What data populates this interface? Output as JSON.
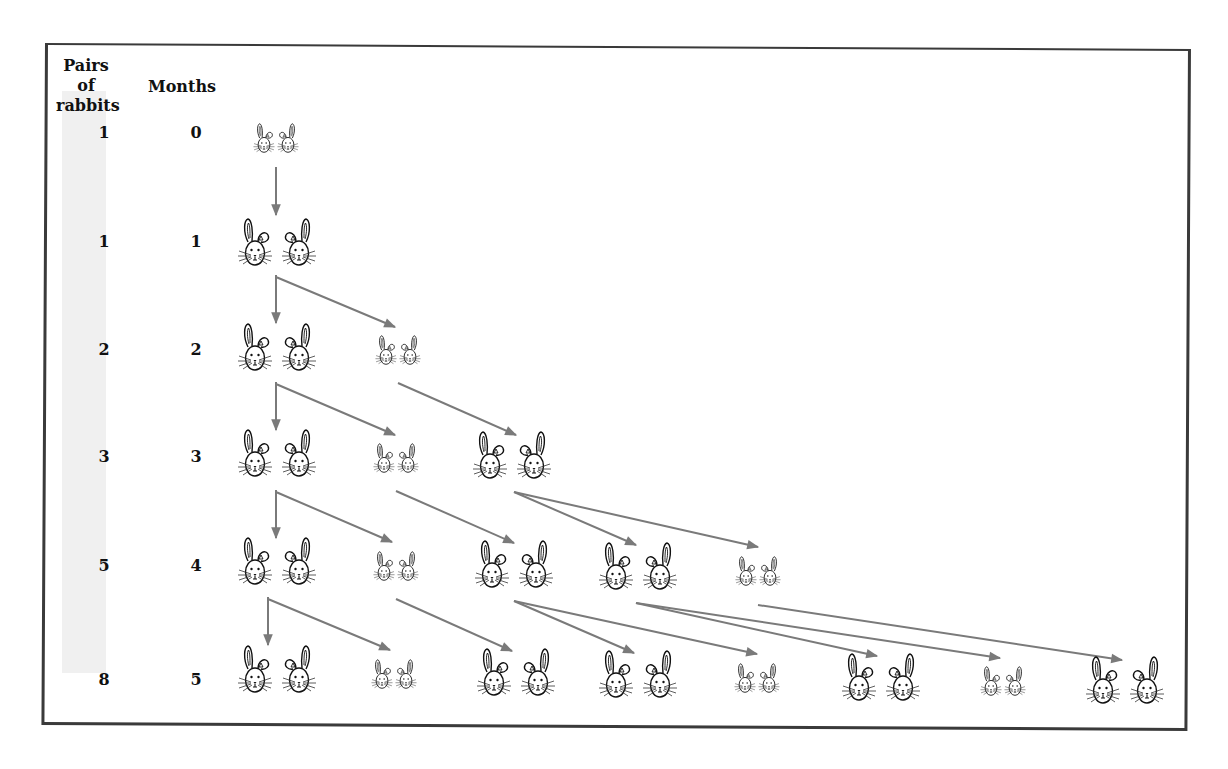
{
  "headers": {
    "pairs": [
      "Pairs of",
      "rabbits"
    ],
    "months": "Months"
  },
  "rows": [
    {
      "pairs": "1",
      "month": "0",
      "y": 133
    },
    {
      "pairs": "1",
      "month": "1",
      "y": 242
    },
    {
      "pairs": "2",
      "month": "2",
      "y": 350
    },
    {
      "pairs": "3",
      "month": "3",
      "y": 457
    },
    {
      "pairs": "5",
      "month": "4",
      "y": 566
    },
    {
      "pairs": "8",
      "month": "5",
      "y": 680
    }
  ],
  "colors": {
    "border": "#3a3a3a",
    "arrow": "#7a7a7a",
    "highlight": "#f0f0f0",
    "ink": "#111111"
  },
  "chart_data": {
    "type": "diagram",
    "x": [
      0,
      1,
      2,
      3,
      4,
      5
    ],
    "values": [
      1,
      1,
      2,
      3,
      5,
      8
    ],
    "xlabel": "Months",
    "ylabel": "Pairs of rabbits"
  },
  "pairs": [
    {
      "x": 276,
      "y": 143,
      "s": "small"
    },
    {
      "x": 277,
      "y": 250,
      "s": "big"
    },
    {
      "x": 277,
      "y": 355,
      "s": "big"
    },
    {
      "x": 398,
      "y": 355,
      "s": "small"
    },
    {
      "x": 277,
      "y": 461,
      "s": "big"
    },
    {
      "x": 396,
      "y": 463,
      "s": "small"
    },
    {
      "x": 512,
      "y": 463,
      "s": "big"
    },
    {
      "x": 277,
      "y": 569,
      "s": "big"
    },
    {
      "x": 396,
      "y": 571,
      "s": "small"
    },
    {
      "x": 514,
      "y": 572,
      "s": "big"
    },
    {
      "x": 638,
      "y": 574,
      "s": "big"
    },
    {
      "x": 758,
      "y": 576,
      "s": "small"
    },
    {
      "x": 277,
      "y": 677,
      "s": "big"
    },
    {
      "x": 394,
      "y": 679,
      "s": "small"
    },
    {
      "x": 516,
      "y": 680,
      "s": "big"
    },
    {
      "x": 638,
      "y": 682,
      "s": "big"
    },
    {
      "x": 757,
      "y": 683,
      "s": "small"
    },
    {
      "x": 881,
      "y": 685,
      "s": "big"
    },
    {
      "x": 1003,
      "y": 686,
      "s": "small"
    },
    {
      "x": 1125,
      "y": 688,
      "s": "big"
    }
  ],
  "arrows": [
    {
      "x1": 276,
      "y1": 167,
      "x2": 276,
      "y2": 215,
      "bend": false
    },
    {
      "x1": 276,
      "y1": 275,
      "x2": 276,
      "y2": 323,
      "bend": false
    },
    {
      "x1": 276,
      "y1": 275,
      "x2": 395,
      "y2": 327,
      "bend": true
    },
    {
      "x1": 276,
      "y1": 382,
      "x2": 276,
      "y2": 430,
      "bend": false
    },
    {
      "x1": 276,
      "y1": 382,
      "x2": 395,
      "y2": 435,
      "bend": true
    },
    {
      "x1": 398,
      "y1": 383,
      "x2": 516,
      "y2": 435,
      "bend": false
    },
    {
      "x1": 276,
      "y1": 490,
      "x2": 276,
      "y2": 538,
      "bend": false
    },
    {
      "x1": 276,
      "y1": 490,
      "x2": 392,
      "y2": 542,
      "bend": true
    },
    {
      "x1": 396,
      "y1": 491,
      "x2": 514,
      "y2": 543,
      "bend": false
    },
    {
      "x1": 514,
      "y1": 492,
      "x2": 636,
      "y2": 545,
      "bend": false
    },
    {
      "x1": 514,
      "y1": 492,
      "x2": 758,
      "y2": 547,
      "bend": false
    },
    {
      "x1": 268,
      "y1": 597,
      "x2": 268,
      "y2": 645,
      "bend": false
    },
    {
      "x1": 268,
      "y1": 597,
      "x2": 390,
      "y2": 650,
      "bend": true
    },
    {
      "x1": 396,
      "y1": 599,
      "x2": 512,
      "y2": 651,
      "bend": false
    },
    {
      "x1": 514,
      "y1": 601,
      "x2": 634,
      "y2": 653,
      "bend": false
    },
    {
      "x1": 514,
      "y1": 601,
      "x2": 757,
      "y2": 654,
      "bend": false
    },
    {
      "x1": 636,
      "y1": 603,
      "x2": 877,
      "y2": 656,
      "bend": false
    },
    {
      "x1": 636,
      "y1": 603,
      "x2": 1000,
      "y2": 658,
      "bend": false
    },
    {
      "x1": 758,
      "y1": 605,
      "x2": 1122,
      "y2": 660,
      "bend": false
    }
  ]
}
